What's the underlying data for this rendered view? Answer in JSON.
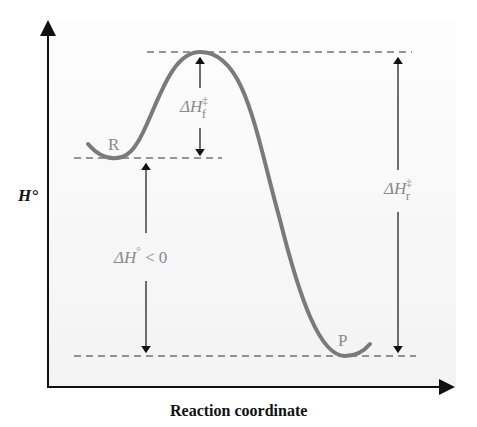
{
  "diagram": {
    "y_axis_label": "H°",
    "x_axis_label": "Reaction coordinate",
    "reactant_label": "R",
    "product_label": "P",
    "forward_barrier": {
      "delta": "ΔH",
      "sup": "‡",
      "sub": "f"
    },
    "reverse_barrier": {
      "delta": "ΔH",
      "sup": "‡",
      "sub": "r"
    },
    "reaction_enthalpy": {
      "delta": "ΔH",
      "sup": "°",
      "relation": "< 0"
    },
    "colors": {
      "curve": "#7a7a7a",
      "text": "#8a8a8a",
      "axis": "#111111"
    }
  }
}
